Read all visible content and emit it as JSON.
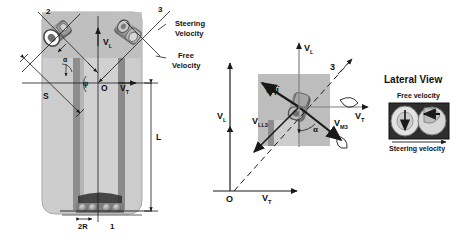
{
  "figure": {
    "panels": [
      {
        "id": "top-view",
        "name": "Top view with castor wheels"
      },
      {
        "id": "velocity-diagram",
        "name": "Velocity vector diagram"
      },
      {
        "id": "lateral-view",
        "name": "Lateral View"
      }
    ]
  },
  "top_view": {
    "castor_number_left": "2",
    "castor_number_right": "3",
    "legend_steering": "Steering\nVelocity",
    "legend_steering_line1": "Steering",
    "legend_steering_line2": "Velocity",
    "legend_free_line1": "Free",
    "legend_free_line2": "Velocity",
    "axis_vl": "V",
    "axis_vl_sub": "L",
    "axis_vt": "V",
    "axis_vt_sub": "T",
    "origin": "O",
    "dim_s": "S",
    "dim_l": "L",
    "dim_2r": "2R",
    "wheel_number_bottom": "1",
    "angle_alpha": "α",
    "angle_psi": "ψ"
  },
  "velocity_diagram": {
    "axis_vl_top": "V",
    "axis_vl_top_sub": "L",
    "axis_vl_left": "V",
    "axis_vl_left_sub": "L",
    "axis_vt_right": "V",
    "axis_vt_right_sub": "T",
    "axis_vt_bottom": "V",
    "axis_vt_bottom_sub": "T",
    "origin": "O",
    "castor_number": "3",
    "vec_spsi": "Sψ̇",
    "vec_vll3": "V",
    "vec_vll3_sub": "LL3",
    "vec_vm3": "V",
    "vec_vm3_sub": "M3",
    "angle_alpha": "α"
  },
  "lateral_view": {
    "title": "Lateral View",
    "label_free_velocity": "Free velocity",
    "label_steering_velocity": "Steering velocity"
  },
  "colors": {
    "chassis_fill": "#c9c9c9",
    "chassis_fill_light": "#d5d5d5",
    "panel_fill": "#bdbdbd",
    "dark_bar": "#8a8a8a",
    "stroke": "#1a1a1a",
    "photo_dark": "#3a3a3a",
    "photo_mid": "#9a9a9a"
  }
}
